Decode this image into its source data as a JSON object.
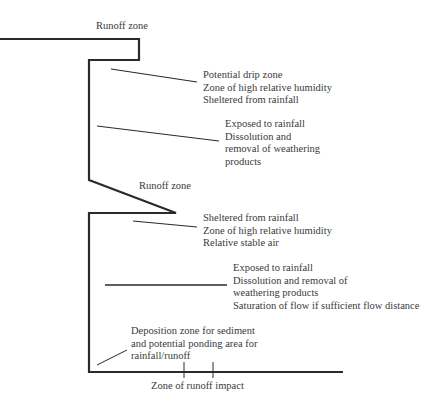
{
  "diagram": {
    "labels": {
      "runoff_top": "Runoff zone",
      "drip": [
        "Potential drip zone",
        "Zone of high relative humidity",
        "Sheltered from rainfall"
      ],
      "exposed_upper": [
        "Exposed to rainfall",
        "Dissolution and",
        "removal of weathering",
        "products"
      ],
      "runoff_mid": "Runoff zone",
      "sheltered_lower": [
        "Sheltered from rainfall",
        "Zone of high relative humidity",
        "Relative stable air"
      ],
      "exposed_lower": [
        "Exposed to rainfall",
        "Dissolution and removal of",
        "weathering products",
        "Saturation of flow if sufficient flow distance"
      ],
      "deposition": [
        "Deposition zone for sediment",
        "and potential ponding area for",
        "rainfall/runoff"
      ],
      "impact": "Zone of runoff impact"
    },
    "colors": {
      "outline": "#2a2a2a",
      "text": "#3a3a3a"
    }
  }
}
